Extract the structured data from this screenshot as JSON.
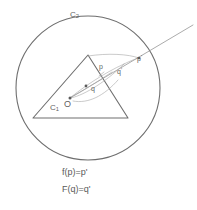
{
  "figure": {
    "background_color": "#ffffff",
    "line_color": "#6e6e6e",
    "text_color": "#5f5f5f"
  },
  "labels": {
    "outer_circle": "C",
    "outer_circle_sub": "2",
    "inner_triangle": "C",
    "inner_triangle_sub": "1",
    "origin": "O",
    "point_p": "p",
    "point_q": "q",
    "point_q_prime": "q",
    "point_q_prime_mark": "'",
    "point_p_prime": "p",
    "point_p_prime_mark": "'"
  },
  "equations": {
    "line1": "f(p)=p'",
    "line2": "F(q)=q'"
  },
  "geometry": {
    "circle": {
      "cx": 88,
      "cy": 88,
      "r": 72
    },
    "triangle": {
      "apex": [
        88,
        55
      ],
      "bottom_left": [
        33,
        118
      ],
      "bottom_right": [
        128,
        118
      ]
    },
    "origin_point": [
      70,
      98
    ],
    "ray_start": [
      70,
      98
    ],
    "ray_exit_circle": [
      139,
      58
    ],
    "ray_end": [
      193,
      25
    ]
  }
}
